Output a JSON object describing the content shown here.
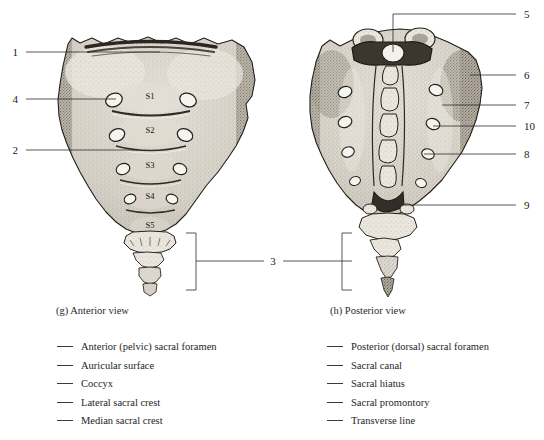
{
  "figure": {
    "panels": [
      {
        "id": "anterior",
        "caption": "(g) Anterior view",
        "vertebra_labels": [
          "S1",
          "S2",
          "S3",
          "S4",
          "S5"
        ],
        "callouts": [
          "1",
          "4",
          "2",
          "3"
        ]
      },
      {
        "id": "posterior",
        "caption": "(h) Posterior view",
        "callouts": [
          "5",
          "6",
          "7",
          "10",
          "8",
          "9"
        ]
      }
    ],
    "callouts": {
      "n1": "1",
      "n2": "2",
      "n3": "3",
      "n4": "4",
      "n5": "5",
      "n6": "6",
      "n7": "7",
      "n8": "8",
      "n9": "9",
      "n10": "10"
    },
    "vertebrae": {
      "s1": "S1",
      "s2": "S2",
      "s3": "S3",
      "s4": "S4",
      "s5": "S5"
    }
  },
  "legend": {
    "left_column": [
      "Anterior (pelvic) sacral foramen",
      "Auricular surface",
      "Coccyx",
      "Lateral sacral crest",
      "Median sacral crest"
    ],
    "right_column": [
      "Posterior (dorsal) sacral foramen",
      "Sacral canal",
      "Sacral hiatus",
      "Sacral promontory",
      "Transverse line"
    ]
  },
  "colors": {
    "background": "#ffffff",
    "ink": "#1a1a1a",
    "bone_light": "#e8e4dc",
    "bone_mid": "#b9b2a6",
    "bone_dark": "#6d665b",
    "leader": "#2b2b2b"
  }
}
